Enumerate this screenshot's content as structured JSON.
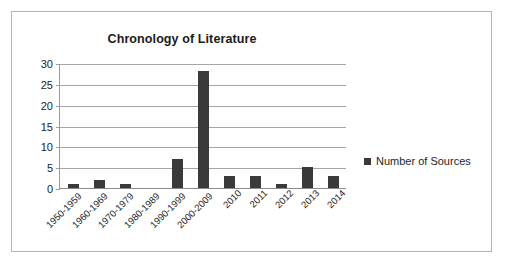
{
  "chart_data": {
    "type": "bar",
    "title": "Chronology of Literature",
    "xlabel": "",
    "ylabel": "",
    "ylim": [
      0,
      30
    ],
    "yticks": [
      0,
      5,
      10,
      15,
      20,
      25,
      30
    ],
    "grid": true,
    "legend_position": "right",
    "categories": [
      "1950-1959",
      "1960-1969",
      "1970-1979",
      "1980-1989",
      "1990-1999",
      "2000-2009",
      "2010",
      "2011",
      "2012",
      "2013",
      "2014"
    ],
    "series": [
      {
        "name": "Number of Sources",
        "values": [
          1,
          2,
          1,
          0,
          7,
          28,
          3,
          3,
          1,
          5,
          3
        ],
        "color": "#3a3a3a"
      }
    ]
  },
  "legend": {
    "entries": [
      {
        "label": "Number of Sources",
        "color": "#3a3a3a"
      }
    ]
  },
  "colors": {
    "bar": "#3a3a3a",
    "gridline": "#a6a6a6",
    "axis": "#8c8c8c",
    "border": "#b4b4b4",
    "text": "#1b1b1b",
    "background": "#ffffff"
  }
}
